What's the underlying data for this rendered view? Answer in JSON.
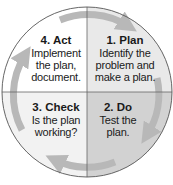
{
  "diagram": {
    "type": "PDCA cycle",
    "direction": "clockwise",
    "colors": {
      "act": "#ffffff",
      "plan": "#e9e9e9",
      "do": "#d2d2d2",
      "check": "#f2f2f2",
      "arrow": "#b8b8b8",
      "outline": "#555555"
    },
    "quadrants": [
      {
        "id": "plan",
        "position": "top-right",
        "title": "1. Plan",
        "lines": [
          "Identify the",
          "problem and",
          "make a plan."
        ]
      },
      {
        "id": "do",
        "position": "bottom-right",
        "title": "2. Do",
        "lines": [
          "Test the",
          "plan."
        ]
      },
      {
        "id": "check",
        "position": "bottom-left",
        "title": "3. Check",
        "lines": [
          "Is the plan",
          "working?"
        ]
      },
      {
        "id": "act",
        "position": "top-left",
        "title": "4. Act",
        "lines": [
          "Implement",
          "the plan,",
          "document."
        ]
      }
    ]
  }
}
